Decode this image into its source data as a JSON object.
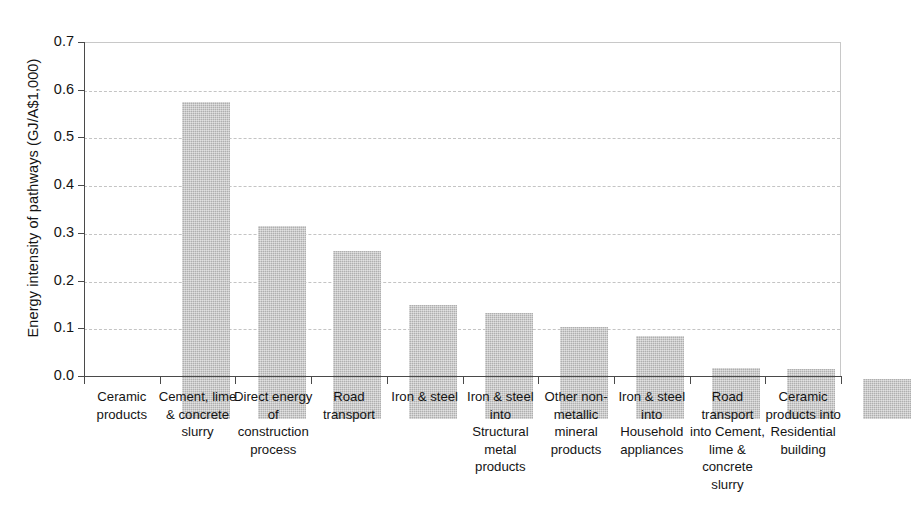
{
  "chart_data": {
    "type": "bar",
    "title": "",
    "subtitle": "",
    "xlabel": "",
    "ylabel": "Energy intensity of pathways (GJ/A$1,000)",
    "ylim": [
      0.0,
      0.7
    ],
    "ytick_labels": [
      "0.7",
      "0.6",
      "0.5",
      "0.4",
      "0.3",
      "0.2",
      "0.1",
      "0.0"
    ],
    "ytick_values": [
      0.7,
      0.6,
      0.5,
      0.4,
      0.3,
      0.2,
      0.1,
      0.0
    ],
    "grid": "horizontal-dashed",
    "legend": "none",
    "bar_color": "#c0c0c0",
    "axis_color": "#4a4a4a",
    "gridline_color": "#c4c4c4",
    "categories": [
      "Ceramic products",
      "Cement, lime & concrete slurry",
      "Direct energy of construction process",
      "Road transport",
      "Iron & steel",
      "Iron & steel into Structural metal products",
      "Other non-metallic mineral products",
      "Iron & steel into Household appliances",
      "Road transport into Cement, lime & concrete slurry",
      "Ceramic products into Residential building"
    ],
    "category_lines": [
      [
        "Ceramic",
        "products"
      ],
      [
        "Cement, lime",
        "& concrete",
        "slurry"
      ],
      [
        "Direct energy",
        "of",
        "construction",
        "process"
      ],
      [
        "Road",
        "transport"
      ],
      [
        "Iron & steel"
      ],
      [
        "Iron & steel",
        "into",
        "Structural",
        "metal",
        "products"
      ],
      [
        "Other non-",
        "metallic",
        "mineral",
        "products"
      ],
      [
        "Iron & steel",
        "into",
        "Household",
        "appliances"
      ],
      [
        "Road",
        "transport",
        "into Cement,",
        "lime &",
        "concrete",
        "slurry"
      ],
      [
        "Ceramic",
        "products into",
        "Residential",
        "building"
      ]
    ],
    "values": [
      0.665,
      0.405,
      0.353,
      0.238,
      0.222,
      0.192,
      0.175,
      0.106,
      0.104,
      0.084
    ]
  }
}
